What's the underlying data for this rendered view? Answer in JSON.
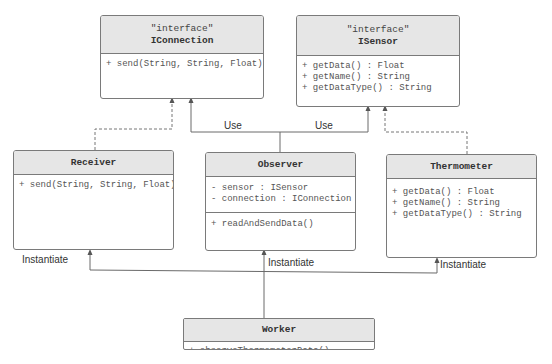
{
  "diagram": {
    "type": "UML class diagram",
    "classes": {
      "iconnection": {
        "stereotype": "\"interface\"",
        "name": "IConnection",
        "operations": [
          "+ send(String, String, Float)"
        ]
      },
      "isensor": {
        "stereotype": "\"interface\"",
        "name": "ISensor",
        "operations": [
          "+ getData() : Float",
          "+ getName() : String",
          "+ getDataType() : String"
        ]
      },
      "receiver": {
        "name": "Receiver",
        "operations": [
          "+ send(String, String, Float)"
        ]
      },
      "observer": {
        "name": "Observer",
        "attributes": [
          "- sensor : ISensor",
          "- connection : IConnection"
        ],
        "operations": [
          "+ readAndSendData()"
        ]
      },
      "thermometer": {
        "name": "Thermometer",
        "operations": [
          "+ getData() : Float",
          "+ getName() : String",
          "+ getDataType() : String"
        ]
      },
      "worker": {
        "name": "Worker",
        "operations": [
          "+ observeThermometerData()"
        ]
      }
    },
    "relations": {
      "use_left": "Use",
      "use_right": "Use",
      "instantiate_receiver": "Instantiate",
      "instantiate_observer": "Instantiate",
      "instantiate_thermometer": "Instantiate"
    },
    "colors": {
      "header_fill": "#e6e6e6",
      "border": "#7a7a7a",
      "line": "#6a6a6a",
      "text": "#555555"
    }
  }
}
